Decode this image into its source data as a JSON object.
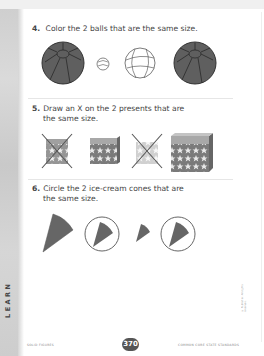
{
  "section_label": "LEARN",
  "questions": [
    {
      "number": "4.",
      "line1": "Color the 2 balls that are the same size.",
      "line2": "",
      "items": [
        "large beach ball",
        "small marble ball",
        "medium basketball",
        "large beach ball"
      ]
    },
    {
      "number": "5.",
      "line1": "Draw an X on the 2 presents that are",
      "line2": "the same size.",
      "items": [
        "small present (crossed)",
        "medium present",
        "small present (crossed)",
        "large present"
      ]
    },
    {
      "number": "6.",
      "line1": "Circle the 2 ice-cream cones that are",
      "line2": "the same size.",
      "items": [
        "large cone",
        "medium cone (circled)",
        "small cone",
        "medium cone (circled)"
      ]
    }
  ],
  "footer": {
    "left": "SOLID FIGURES",
    "page_number": "370",
    "right": "COMMON CORE STATE STANDARDS"
  },
  "colors": {
    "fill": "#5f5f5f",
    "outline": "#333333",
    "strip": "#d0d0d0",
    "badge": "#555555"
  }
}
